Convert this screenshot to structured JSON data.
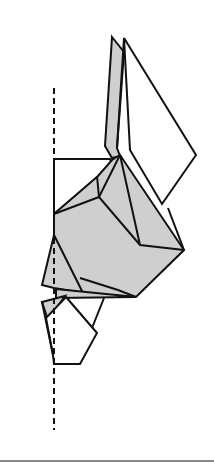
{
  "diagram": {
    "type": "origami-step",
    "colors": {
      "stroke": "#111111",
      "shaded_fill": "#cfcfcf",
      "paper_fill": "#ffffff",
      "divider": "#8a8a8a"
    },
    "fold_line": {
      "style": "dashed",
      "x": 54,
      "y1": 88,
      "y2": 430
    }
  }
}
